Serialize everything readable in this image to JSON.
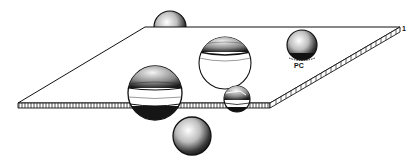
{
  "figure": {
    "colors": {
      "background": "#ffffff",
      "ink": "#111111",
      "shade": "#222222"
    },
    "labels": {
      "pc": "PC",
      "corner": "1"
    },
    "plane": {
      "back_left": [
        145,
        27
      ],
      "back_right": [
        400,
        27
      ],
      "front_right": [
        270,
        103
      ],
      "front_left": [
        18,
        103
      ],
      "thickness": 5
    },
    "spheres": [
      {
        "name": "sphere-above-back",
        "cx": 170,
        "cy": 27,
        "r": 16,
        "style": "solid"
      },
      {
        "name": "sphere-partially-inserted",
        "cx": 225,
        "cy": 63,
        "r": 26,
        "style": "cap"
      },
      {
        "name": "sphere-pc",
        "cx": 302,
        "cy": 45,
        "r": 15,
        "style": "solid"
      },
      {
        "name": "sphere-transmembrane-large",
        "cx": 155,
        "cy": 93,
        "r": 27,
        "style": "banded"
      },
      {
        "name": "sphere-transmembrane-small",
        "cx": 237,
        "cy": 99,
        "r": 13,
        "style": "banded"
      },
      {
        "name": "sphere-below",
        "cx": 192,
        "cy": 136,
        "r": 19,
        "style": "solid"
      }
    ]
  }
}
